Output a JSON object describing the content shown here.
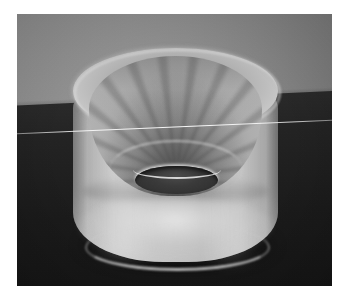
{
  "image": {
    "domain": "Natural-Image",
    "title": "Photograph of a translucent plastic funnel cup",
    "caption": "",
    "canvas": {
      "width": 343,
      "height": 300,
      "background": "#ffffff"
    },
    "photo_frame": {
      "left": 17,
      "top": 14,
      "width": 315,
      "height": 272
    },
    "scene": {
      "subject": "translucent frosted plastic funnel / cup with radial internal ribs and a central drain hole",
      "view": "three-quarter front view, slightly above",
      "lighting": "diffuse light from upper front, bright transmission glow through the lower body"
    },
    "regions": {
      "backdrop": {
        "name": "grey studio backdrop",
        "color": "#8c8c8c"
      },
      "table": {
        "name": "dark table surface",
        "color": "#1e1e1e"
      },
      "horizon": {
        "name": "backdrop-to-table horizon line",
        "left_y": 135,
        "right_y": 121
      },
      "object": {
        "name": "funnel-cup",
        "color": "#b6b6b6",
        "outer_left_x": 73,
        "outer_right_x": 278,
        "top_y": 48,
        "bottom_y": 268,
        "rim_color": "#c4c4c4"
      },
      "inner_cone": {
        "name": "ribbed inner cone",
        "color": "#9a9a9a",
        "rib_count": 24
      },
      "center_hole": {
        "name": "central dark hole",
        "color": "#343434",
        "center_x": 175,
        "center_y": 160,
        "width": 83,
        "height": 28
      },
      "shadow": {
        "name": "cast shadow under object",
        "color": "#000000"
      },
      "scratch": {
        "name": "bright film scratch line",
        "left_y": 134,
        "right_y": 121,
        "color": "#ffffff"
      }
    }
  }
}
